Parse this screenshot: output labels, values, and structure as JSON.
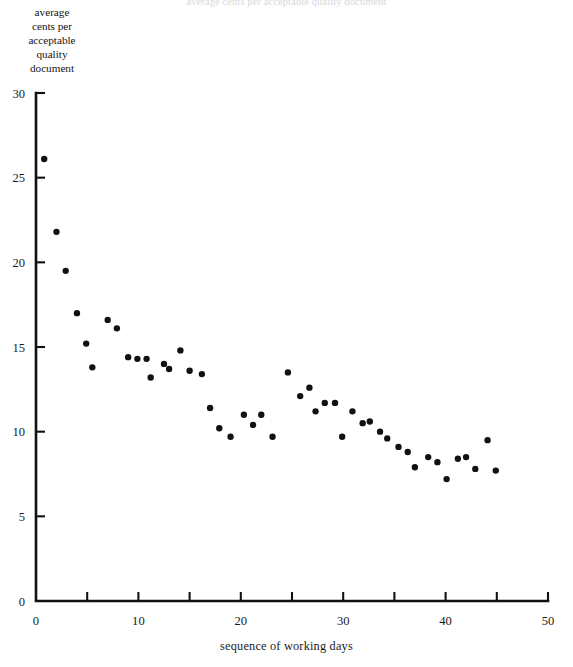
{
  "figure": {
    "top_caption": "average cents per acceptable quality document",
    "y_axis_caption_lines": [
      "average",
      "cents per",
      "acceptable",
      "quality",
      "document"
    ],
    "x_axis_caption": "sequence of working days"
  },
  "chart_data": {
    "type": "scatter",
    "title": "",
    "xlabel": "sequence of working days",
    "ylabel": "average cents per acceptable quality document",
    "xlim": [
      0,
      50
    ],
    "ylim": [
      0,
      30
    ],
    "xticks": [
      0,
      10,
      20,
      30,
      40,
      50
    ],
    "xticklabels": [
      "0",
      "10",
      "20",
      "30",
      "40",
      "50"
    ],
    "xminorticks": [
      5,
      15,
      25,
      35,
      45
    ],
    "yticks": [
      0,
      5,
      10,
      15,
      20,
      25,
      30
    ],
    "yticklabels": [
      "0",
      "5",
      "10",
      "15",
      "20",
      "25",
      "30"
    ],
    "grid": false,
    "legend": null,
    "marker": "circle",
    "marker_color": "#111111",
    "marker_size": 4.6,
    "points": [
      {
        "x": 0.8,
        "y": 26.1
      },
      {
        "x": 2.0,
        "y": 21.8
      },
      {
        "x": 2.9,
        "y": 19.5
      },
      {
        "x": 4.0,
        "y": 17.0
      },
      {
        "x": 4.9,
        "y": 15.2
      },
      {
        "x": 5.5,
        "y": 13.8
      },
      {
        "x": 7.0,
        "y": 16.6
      },
      {
        "x": 7.9,
        "y": 16.1
      },
      {
        "x": 9.0,
        "y": 14.4
      },
      {
        "x": 9.9,
        "y": 14.3
      },
      {
        "x": 10.8,
        "y": 14.3
      },
      {
        "x": 11.2,
        "y": 13.2
      },
      {
        "x": 12.5,
        "y": 14.0
      },
      {
        "x": 13.0,
        "y": 13.7
      },
      {
        "x": 14.1,
        "y": 14.8
      },
      {
        "x": 15.0,
        "y": 13.6
      },
      {
        "x": 16.2,
        "y": 13.4
      },
      {
        "x": 17.0,
        "y": 11.4
      },
      {
        "x": 17.9,
        "y": 10.2
      },
      {
        "x": 19.0,
        "y": 9.7
      },
      {
        "x": 20.3,
        "y": 11.0
      },
      {
        "x": 21.2,
        "y": 10.4
      },
      {
        "x": 22.0,
        "y": 11.0
      },
      {
        "x": 23.1,
        "y": 9.7
      },
      {
        "x": 24.6,
        "y": 13.5
      },
      {
        "x": 25.8,
        "y": 12.1
      },
      {
        "x": 26.7,
        "y": 12.6
      },
      {
        "x": 27.3,
        "y": 11.2
      },
      {
        "x": 28.2,
        "y": 11.7
      },
      {
        "x": 29.2,
        "y": 11.7
      },
      {
        "x": 29.9,
        "y": 9.7
      },
      {
        "x": 30.9,
        "y": 11.2
      },
      {
        "x": 31.9,
        "y": 10.5
      },
      {
        "x": 32.6,
        "y": 10.6
      },
      {
        "x": 33.6,
        "y": 10.0
      },
      {
        "x": 34.3,
        "y": 9.6
      },
      {
        "x": 35.4,
        "y": 9.1
      },
      {
        "x": 36.3,
        "y": 8.8
      },
      {
        "x": 37.0,
        "y": 7.9
      },
      {
        "x": 38.3,
        "y": 8.5
      },
      {
        "x": 39.2,
        "y": 8.2
      },
      {
        "x": 40.1,
        "y": 7.2
      },
      {
        "x": 41.2,
        "y": 8.4
      },
      {
        "x": 42.0,
        "y": 8.5
      },
      {
        "x": 42.9,
        "y": 7.8
      },
      {
        "x": 44.1,
        "y": 9.5
      },
      {
        "x": 44.9,
        "y": 7.7
      }
    ]
  }
}
